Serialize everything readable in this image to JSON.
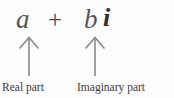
{
  "figure": {
    "type": "annotated-formula",
    "background_color": "#fdfdfd",
    "expression": {
      "full": "a + bi",
      "real_symbol": "a",
      "operator": "+",
      "imaginary_coefficient": "b",
      "imaginary_unit": "i",
      "text_color": "#565656"
    },
    "annotations": [
      {
        "id": "real",
        "label": "Real part",
        "points_to": "a",
        "arrow_direction": "up",
        "arrow_color": "#8a8a8a"
      },
      {
        "id": "imaginary",
        "label": "Imaginary part",
        "points_to": "bi",
        "arrow_direction": "up",
        "arrow_color": "#8a8a8a"
      }
    ]
  }
}
